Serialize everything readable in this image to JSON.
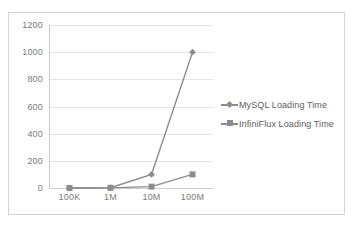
{
  "chart_data": {
    "type": "line",
    "title": "",
    "xlabel": "",
    "ylabel": "",
    "categories": [
      "100K",
      "1M",
      "10M",
      "100M"
    ],
    "series": [
      {
        "name": "MySQL Loading Time",
        "marker": "diamond",
        "color": "#8c8c8c",
        "values": [
          0,
          2,
          100,
          1000
        ]
      },
      {
        "name": "InfiniFlux Loading Time",
        "marker": "square",
        "color": "#8c8c8c",
        "values": [
          0,
          1,
          10,
          100
        ]
      }
    ],
    "ylim": [
      0,
      1200
    ],
    "yticks": [
      0,
      200,
      400,
      600,
      800,
      1000,
      1200
    ],
    "ytick_labels": [
      "0",
      "200",
      "400",
      "600",
      "800",
      "1000",
      "1200"
    ],
    "grid": true,
    "legend_position": "right",
    "axis_color": "#c9c9c9",
    "grid_color": "#e4e4e4",
    "tick_label_color": "#7b7b7b",
    "frame_color": "#d3d3d3",
    "background": "#ffffff"
  },
  "legend": {
    "entries": [
      {
        "label": "MySQL Loading Time",
        "marker": "diamond"
      },
      {
        "label": "InfiniFlux Loading Time",
        "marker": "square"
      }
    ]
  }
}
